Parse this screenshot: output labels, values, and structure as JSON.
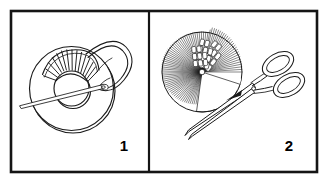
{
  "figure": {
    "type": "two-panel line-art diagram",
    "background_color": "#ffffff",
    "ink_color": "#000000",
    "frame": {
      "stroke_color": "#151515",
      "outer_stroke_width": 2.6,
      "divider_stroke_width": 2.2,
      "x": 11,
      "y": 11,
      "width": 306,
      "height": 161,
      "divider_x": 149
    }
  },
  "panels": [
    {
      "id": "panel-1",
      "number_label": "1",
      "number_x": 124,
      "number_y": 151,
      "caption": "Wind yarn around the cardboard ring using a needle",
      "objects": [
        {
          "name": "cardboard-donut-ring",
          "outer_circle": {
            "cx": 73,
            "cy": 89,
            "r": 42
          },
          "inner_circle": {
            "cx": 73,
            "cy": 89,
            "r": 17
          },
          "thickness_offset": 3.5
        },
        {
          "name": "wound-yarn-bundle",
          "description": "fan of yarn strands wrapped over the upper-left arc of the ring",
          "strand_count": 16,
          "angle_start_deg": 200,
          "angle_end_deg": 290
        },
        {
          "name": "yarn-loop",
          "description": "large loop of yarn arcing up and to the right from the ring"
        },
        {
          "name": "sewing-needle",
          "description": "long thin needle passing through the ring centre, point extending to lower-left",
          "x1": 19,
          "y1": 104,
          "x2": 108,
          "y2": 83
        }
      ]
    },
    {
      "id": "panel-2",
      "number_label": "2",
      "number_x": 289,
      "number_y": 151,
      "caption": "Cut the yarn around the outer edge with scissors",
      "objects": [
        {
          "name": "wound-pompom-disc",
          "description": "fully wrapped disc of radial yarn strands",
          "cx": 202,
          "cy": 72,
          "r": 40,
          "strand_count": 96
        },
        {
          "name": "cut-yarn-ends",
          "description": "lower-right wedge showing cut strand ends as small rectangles",
          "wedge_start_deg": 40,
          "wedge_end_deg": 110
        },
        {
          "name": "pompom-centre-core",
          "cx": 202,
          "cy": 72,
          "r": 2.6
        },
        {
          "name": "scissors",
          "description": "open scissors with two oval handles at upper-right and blades pointing to lower-left",
          "handle_a": {
            "cx": 276,
            "cy": 68,
            "rx": 15,
            "ry": 9,
            "rotation_deg": -28
          },
          "handle_b": {
            "cx": 286,
            "cy": 88,
            "rx": 15,
            "ry": 9,
            "rotation_deg": -28
          },
          "pivot": {
            "cx": 253,
            "cy": 90,
            "r": 1.8
          },
          "blade_tip": {
            "x": 185,
            "y": 135
          }
        }
      ]
    }
  ]
}
